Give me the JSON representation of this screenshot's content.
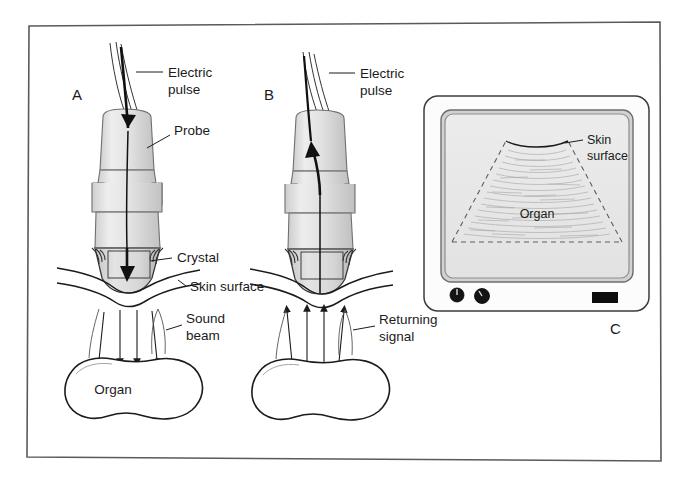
{
  "figure": {
    "background_color": "#ffffff",
    "frame_color": "#4a4a4a"
  },
  "panels": [
    {
      "id": "A",
      "letter": "A",
      "description": "Transmission: electric pulse travels down probe to crystal, producing sound beam into organ",
      "labels": {
        "electric_pulse_line1": "Electric",
        "electric_pulse_line2": "pulse",
        "probe": "Probe",
        "crystal": "Crystal",
        "skin_surface": "Skin surface",
        "sound_beam_line1": "Sound",
        "sound_beam_line2": "beam",
        "organ": "Organ"
      }
    },
    {
      "id": "B",
      "letter": "B",
      "description": "Reception: returning signal travels up from organ through skin into crystal and out as electric pulse",
      "labels": {
        "electric_pulse_line1": "Electric",
        "electric_pulse_line2": "pulse",
        "returning_signal_line1": "Returning",
        "returning_signal_line2": "signal",
        "organ": "Organ"
      }
    },
    {
      "id": "C",
      "letter": "C",
      "description": "Display monitor showing sector ultrasound image",
      "labels": {
        "skin_surface_line1": "Skin",
        "skin_surface_line2": "surface",
        "organ": "Organ"
      },
      "monitor": {
        "knob_count": 2,
        "indicator": "power-indicator"
      }
    }
  ],
  "colors": {
    "probe_fill_light": "#ededed",
    "probe_fill_mid": "#d8d8d8",
    "probe_fill_dark": "#bdbdbd",
    "outline": "#1b1b1b",
    "screen_fill": "#e8e8e8",
    "bezel_fill": "#fcfcfc",
    "bezel_edge": "#9a9a9a",
    "knob_fill": "#141414",
    "speckle": "#a9a9a9"
  }
}
